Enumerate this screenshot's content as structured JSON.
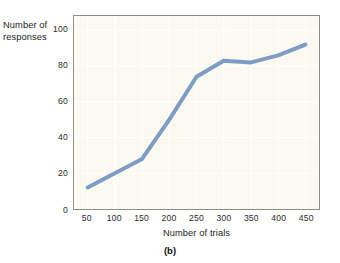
{
  "figure": {
    "caption": "(b)",
    "background_color": "#ffffff",
    "plot_background_color": "#fbfaf0",
    "line_color": "#7e9cc6",
    "border_color": "#8d8d86"
  },
  "chart_data": {
    "type": "line",
    "title": "",
    "xlabel": "Number of trials",
    "ylabel": "Number of responses",
    "x": [
      50,
      100,
      150,
      200,
      250,
      300,
      350,
      400,
      450
    ],
    "values": [
      12,
      20,
      28,
      50,
      74,
      83,
      82,
      86,
      92
    ],
    "series": [
      {
        "name": "responses",
        "values": [
          12,
          20,
          28,
          50,
          74,
          83,
          82,
          86,
          92
        ]
      }
    ],
    "xticks": [
      50,
      100,
      150,
      200,
      250,
      300,
      350,
      400,
      450
    ],
    "yticks": [
      0,
      20,
      40,
      60,
      80,
      100
    ],
    "xlim": [
      25,
      475
    ],
    "ylim": [
      0,
      108
    ],
    "grid": true,
    "legend": false,
    "legend_position": "none",
    "markers": false,
    "line_width": 4
  },
  "labels": {
    "y_axis_line1": "Number of",
    "y_axis_line2": "responses",
    "x_axis": "Number of trials",
    "caption": "(b)",
    "yticks": [
      "0",
      "20",
      "40",
      "60",
      "80",
      "100"
    ],
    "xticks": [
      "50",
      "100",
      "150",
      "200",
      "250",
      "300",
      "350",
      "400",
      "450"
    ]
  }
}
